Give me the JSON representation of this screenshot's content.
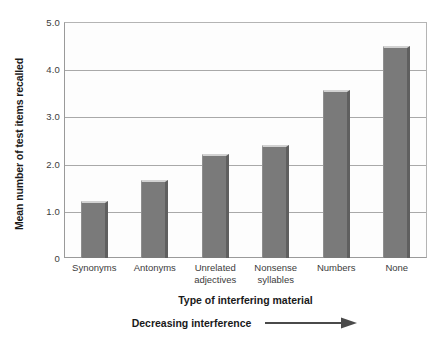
{
  "chart_data": {
    "type": "bar",
    "title": "",
    "categories": [
      "Synonyms",
      "Antonyms",
      "Unrelated adjectives",
      "Nonsense syllables",
      "Numbers",
      "None"
    ],
    "category_lines": [
      [
        "Synonyms"
      ],
      [
        "Antonyms"
      ],
      [
        "Unrelated",
        "adjectives"
      ],
      [
        "Nonsense",
        "syllables"
      ],
      [
        "Numbers"
      ],
      [
        "None"
      ]
    ],
    "values": [
      1.2,
      1.65,
      2.2,
      2.4,
      3.55,
      4.5
    ],
    "xlabel": "Type of interfering material",
    "ylabel": "Mean number of test items recalled",
    "ylim": [
      0,
      5
    ],
    "yticks": [
      0,
      1,
      2,
      3,
      4,
      5
    ],
    "ytick_labels": [
      "0",
      "1.0",
      "2.0",
      "3.0",
      "4.0",
      "5.0"
    ],
    "grid": "horizontal",
    "legend": "none",
    "annotation": "Decreasing interference",
    "annotation_arrow": "right-arrow",
    "bar_color": "#7a7a7a",
    "bar_highlight_color": "#d2d2d2",
    "bar_shadow_color": "#5f5f5f",
    "grid_color": "#a9a9a9",
    "axis_color": "#9a9a9a",
    "text_color": "#3c3c3c",
    "title_color": "#1a1a1a",
    "plot_background": "#fdfdfd",
    "figure_background": "#ffffff"
  }
}
